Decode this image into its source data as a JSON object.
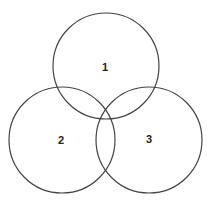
{
  "diagram": {
    "type": "venn",
    "stroke_color": "#444444",
    "circles": [
      {
        "id": "1",
        "label": "1",
        "cx": 106,
        "cy": 66,
        "r": 53
      },
      {
        "id": "2",
        "label": "2",
        "cx": 62,
        "cy": 140,
        "r": 53
      },
      {
        "id": "3",
        "label": "3",
        "cx": 149,
        "cy": 140,
        "r": 53
      }
    ]
  }
}
